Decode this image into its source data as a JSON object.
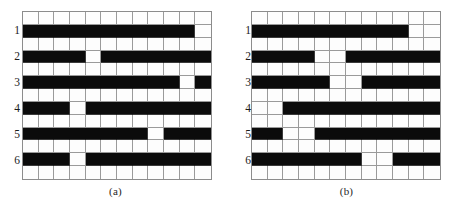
{
  "figure": {
    "type": "schedule-grid-pair",
    "columns": 12,
    "rows": 13,
    "colors": {
      "filled": "#0b0b0b",
      "empty": "#fdfdfd",
      "gridline": "#9a9a9a",
      "border": "#8c8c8c",
      "text": "#1b1b1b"
    },
    "row_labels": [
      "1",
      "2",
      "3",
      "4",
      "5",
      "6"
    ],
    "row_label_grid_rows": [
      1,
      3,
      5,
      7,
      9,
      11
    ]
  },
  "panels": [
    {
      "id": "a",
      "caption": "(a)",
      "name": "panel-a",
      "grid": [
        [
          0,
          0,
          0,
          0,
          0,
          0,
          0,
          0,
          0,
          0,
          0,
          0
        ],
        [
          1,
          1,
          1,
          1,
          1,
          1,
          1,
          1,
          1,
          1,
          1,
          0
        ],
        [
          0,
          0,
          0,
          0,
          0,
          0,
          0,
          0,
          0,
          0,
          0,
          0
        ],
        [
          1,
          1,
          1,
          1,
          0,
          1,
          1,
          1,
          1,
          1,
          1,
          1
        ],
        [
          0,
          0,
          0,
          0,
          0,
          0,
          0,
          0,
          0,
          0,
          0,
          0
        ],
        [
          1,
          1,
          1,
          1,
          1,
          1,
          1,
          1,
          1,
          1,
          0,
          1
        ],
        [
          0,
          0,
          0,
          0,
          0,
          0,
          0,
          0,
          0,
          0,
          0,
          0
        ],
        [
          1,
          1,
          1,
          0,
          1,
          1,
          1,
          1,
          1,
          1,
          1,
          1
        ],
        [
          0,
          0,
          0,
          0,
          0,
          0,
          0,
          0,
          0,
          0,
          0,
          0
        ],
        [
          1,
          1,
          1,
          1,
          1,
          1,
          1,
          1,
          0,
          1,
          1,
          1
        ],
        [
          0,
          0,
          0,
          0,
          0,
          0,
          0,
          0,
          0,
          0,
          0,
          0
        ],
        [
          1,
          1,
          1,
          0,
          1,
          1,
          1,
          1,
          1,
          1,
          1,
          1
        ],
        [
          0,
          0,
          0,
          0,
          0,
          0,
          0,
          0,
          0,
          0,
          0,
          0
        ]
      ]
    },
    {
      "id": "b",
      "caption": "(b)",
      "name": "panel-b",
      "grid": [
        [
          0,
          0,
          0,
          0,
          0,
          0,
          0,
          0,
          0,
          0,
          0,
          0
        ],
        [
          1,
          1,
          1,
          1,
          1,
          1,
          1,
          1,
          1,
          1,
          0,
          0
        ],
        [
          0,
          0,
          0,
          0,
          0,
          0,
          0,
          0,
          0,
          0,
          0,
          0
        ],
        [
          1,
          1,
          1,
          1,
          0,
          0,
          1,
          1,
          1,
          1,
          1,
          1
        ],
        [
          0,
          0,
          0,
          0,
          0,
          0,
          0,
          0,
          0,
          0,
          0,
          0
        ],
        [
          1,
          1,
          1,
          1,
          1,
          0,
          0,
          1,
          1,
          1,
          1,
          1
        ],
        [
          0,
          0,
          0,
          0,
          0,
          0,
          0,
          0,
          0,
          0,
          0,
          0
        ],
        [
          0,
          0,
          1,
          1,
          1,
          1,
          1,
          1,
          1,
          1,
          1,
          1
        ],
        [
          0,
          0,
          0,
          0,
          0,
          0,
          0,
          0,
          0,
          0,
          0,
          0
        ],
        [
          1,
          1,
          0,
          0,
          1,
          1,
          1,
          1,
          1,
          1,
          1,
          1
        ],
        [
          0,
          0,
          0,
          0,
          0,
          0,
          0,
          0,
          0,
          0,
          0,
          0
        ],
        [
          1,
          1,
          1,
          1,
          1,
          1,
          1,
          0,
          0,
          1,
          1,
          1
        ],
        [
          0,
          0,
          0,
          0,
          0,
          0,
          0,
          0,
          0,
          0,
          0,
          0
        ]
      ]
    }
  ]
}
